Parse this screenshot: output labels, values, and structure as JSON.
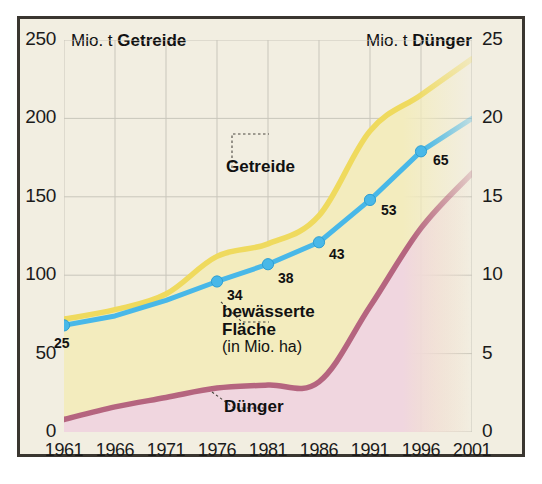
{
  "header": {
    "left_prefix": "Mio. t ",
    "left_strong": "Getreide",
    "right_prefix": "Mio. t ",
    "right_strong": "Dünger"
  },
  "annotations": {
    "getreide": "Getreide",
    "bewaesserte_line1": "bewässerte",
    "bewaesserte_line2": "Fläche",
    "bewaesserte_line3": "(in Mio. ha)",
    "duenger": "Dünger"
  },
  "colors": {
    "background": "#f2eee1",
    "frame": "#3a3630",
    "grain_line": "#f0dd6a",
    "grain_fill": "#f3ecbe",
    "fertilizer_line": "#b5657f",
    "fertilizer_fill": "#f0d6df",
    "irrigated_line": "#48b8e8",
    "grid": "#c9c6bb",
    "text": "#1b1b1b"
  },
  "chart_data": {
    "type": "area",
    "title": "",
    "xlabel": "",
    "x": [
      1961,
      1966,
      1971,
      1976,
      1981,
      1986,
      1991,
      1996,
      2001
    ],
    "xlim": [
      1961,
      2001
    ],
    "xticks": [
      "1961",
      "1966",
      "1971",
      "1976",
      "1981",
      "1986",
      "1991",
      "1996",
      "2001"
    ],
    "grid": true,
    "legend_position": "inline-callouts",
    "axes": [
      {
        "id": "left",
        "label_prefix": "Mio. t ",
        "label_strong": "Getreide",
        "ylim": [
          0,
          250
        ],
        "yticks": [
          "0",
          "50",
          "100",
          "150",
          "200",
          "250"
        ],
        "ytick_values": [
          0,
          50,
          100,
          150,
          200,
          250
        ]
      },
      {
        "id": "right",
        "label_prefix": "Mio. t ",
        "label_strong": "Dünger",
        "ylim": [
          0,
          25
        ],
        "yticks": [
          "0",
          "5",
          "10",
          "15",
          "20",
          "25"
        ],
        "ytick_values": [
          0,
          5,
          10,
          15,
          20,
          25
        ]
      }
    ],
    "series": [
      {
        "name": "Getreide",
        "axis": "left",
        "unit": "Mio. t",
        "type": "area",
        "color": "#f0dd6a",
        "fill": "#f3ecbe",
        "values": [
          72,
          78,
          88,
          112,
          120,
          138,
          192,
          215,
          238
        ]
      },
      {
        "name": "Dünger",
        "axis": "right",
        "unit": "Mio. t",
        "type": "area",
        "color": "#b5657f",
        "fill": "#f0d6df",
        "values": [
          0.8,
          1.6,
          2.2,
          2.8,
          3.0,
          3.2,
          8.0,
          13.0,
          16.5
        ]
      },
      {
        "name": "bewässerte Fläche",
        "axis": "left",
        "unit": "Mio. ha",
        "type": "line",
        "color": "#48b8e8",
        "markers": true,
        "values": [
          68,
          74,
          84,
          96,
          107,
          121,
          148,
          179,
          200
        ],
        "point_labels": [
          "25",
          "",
          "",
          "34",
          "38",
          "43",
          "53",
          "65",
          ""
        ],
        "labeled_points": [
          {
            "x": 1961,
            "label": "25"
          },
          {
            "x": 1976,
            "label": "34"
          },
          {
            "x": 1981,
            "label": "38"
          },
          {
            "x": 1986,
            "label": "43"
          },
          {
            "x": 1991,
            "label": "53"
          },
          {
            "x": 1996,
            "label": "65"
          }
        ]
      }
    ]
  }
}
